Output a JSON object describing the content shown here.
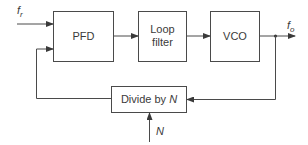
{
  "diagram": {
    "type": "block-diagram",
    "blocks": [
      {
        "id": "pfd",
        "label_lines": [
          "PFD"
        ]
      },
      {
        "id": "loop_filter",
        "label_lines": [
          "Loop",
          "filter"
        ]
      },
      {
        "id": "vco",
        "label_lines": [
          "VCO"
        ]
      },
      {
        "id": "divider",
        "label_prefix": "Divide by ",
        "label_var": "N"
      }
    ],
    "signals": {
      "reference_input": {
        "symbol": "f",
        "subscript": "r"
      },
      "output": {
        "symbol": "f",
        "subscript": "o"
      },
      "divide_control": {
        "symbol": "N"
      }
    },
    "connections": [
      {
        "from": "f_r",
        "to": "pfd"
      },
      {
        "from": "pfd",
        "to": "loop_filter"
      },
      {
        "from": "loop_filter",
        "to": "vco"
      },
      {
        "from": "vco",
        "to": "f_o"
      },
      {
        "from": "vco",
        "to": "divider"
      },
      {
        "from": "divider",
        "to": "pfd"
      },
      {
        "from": "N",
        "to": "divider"
      }
    ],
    "colors": {
      "line": "#4a4a4a",
      "text": "#3a3a3a",
      "background": "#ffffff"
    }
  }
}
